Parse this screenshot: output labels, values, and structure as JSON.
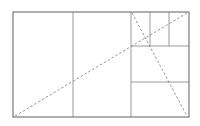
{
  "diagram": {
    "type": "golden-rectangle-subdivision",
    "canvas": {
      "width": 200,
      "height": 126,
      "background": "#ffffff"
    },
    "stroke_color": "#7a7a7a",
    "inner_stroke_color": "#9a9a9a",
    "dash_color": "#8a8a8a",
    "outer_rect": {
      "x1": 13,
      "y1": 12,
      "x2": 189,
      "y2": 117
    },
    "vertical_lines": [
      {
        "x": 73,
        "y1": 12,
        "y2": 117
      },
      {
        "x": 131,
        "y1": 12,
        "y2": 117
      },
      {
        "x": 150,
        "y1": 12,
        "y2": 46
      },
      {
        "x": 169,
        "y1": 12,
        "y2": 46
      }
    ],
    "horizontal_lines": [
      {
        "y": 46,
        "x1": 131,
        "x2": 189
      },
      {
        "y": 82,
        "x1": 131,
        "x2": 189
      }
    ],
    "dashed_diagonals": [
      {
        "x1": 15,
        "y1": 116,
        "x2": 187,
        "y2": 13
      },
      {
        "x1": 132,
        "y1": 13,
        "x2": 187,
        "y2": 116
      }
    ]
  }
}
